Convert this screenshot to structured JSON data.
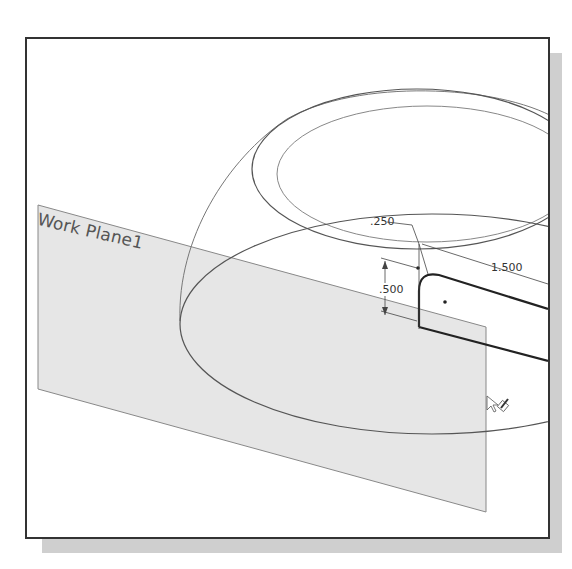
{
  "viewport": {
    "background": "#ffffff",
    "border_color": "#333333",
    "shadow_color": "#cfcfcf"
  },
  "work_plane": {
    "label": "Work Plane1",
    "fill": "#e6e6e6"
  },
  "dimensions": {
    "fillet_radius": ".250",
    "length": "1.500",
    "height": ".500"
  },
  "cursor": {
    "icon": "pointer-with-sketch-pencil-icon"
  }
}
